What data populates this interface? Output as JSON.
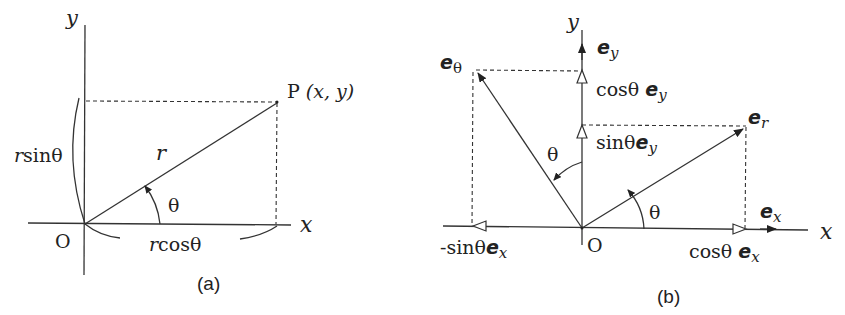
{
  "panel_a": {
    "caption": "(a)",
    "axis_x": "x",
    "axis_y": "y",
    "origin": "O",
    "point_label_P": "P",
    "point_label_coords": "(x, y)",
    "radius_label": "r",
    "angle_label": "θ",
    "r_sin_prefix": "r",
    "r_sin_suffix": "sinθ",
    "r_cos_prefix": "r",
    "r_cos_suffix": "cosθ"
  },
  "panel_b": {
    "caption": "(b)",
    "axis_x": "x",
    "axis_y": "y",
    "origin": "O",
    "e": "e",
    "sub_theta": "θ",
    "sub_r": "r",
    "sub_x": "x",
    "sub_y": "y",
    "cos_theta": "cosθ",
    "sin_theta": "sinθ",
    "neg_sin_theta": "-sinθ",
    "angle_label": "θ"
  }
}
